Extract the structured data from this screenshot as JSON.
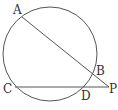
{
  "diagram": {
    "circle": {
      "cx": 50,
      "cy": 54,
      "r": 47,
      "stroke": "#555555"
    },
    "points": [
      {
        "name": "A",
        "x": 22,
        "y": 17,
        "label": "A",
        "lx": 13,
        "ly": 14
      },
      {
        "name": "B",
        "x": 92,
        "y": 76,
        "label": "B",
        "lx": 96,
        "ly": 73
      },
      {
        "name": "C",
        "x": 15,
        "y": 87,
        "label": "C",
        "lx": 4,
        "ly": 92
      },
      {
        "name": "D",
        "x": 84,
        "y": 87,
        "label": "D",
        "lx": 82,
        "ly": 100
      },
      {
        "name": "P",
        "x": 109,
        "y": 87,
        "label": "P",
        "lx": 110,
        "ly": 92
      }
    ],
    "segments": [
      {
        "from": "A",
        "to": "P"
      },
      {
        "from": "C",
        "to": "P"
      }
    ],
    "line_color": "#555555"
  }
}
